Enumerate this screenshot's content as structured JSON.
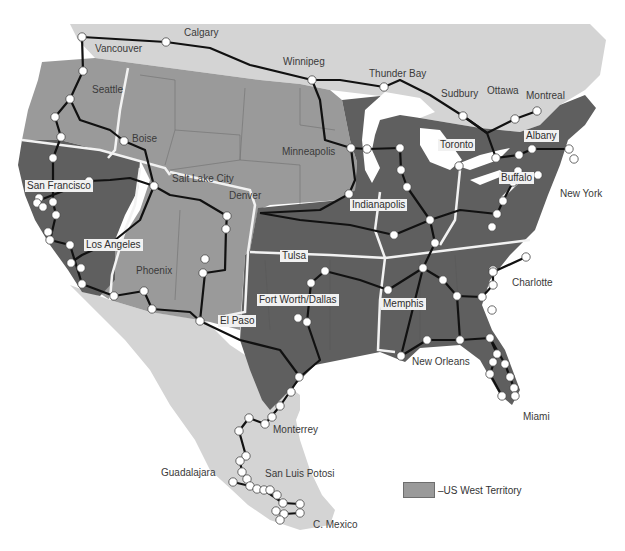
{
  "map": {
    "title": "Rail network territories",
    "colors": {
      "background": "#ffffff",
      "canada_mexico": "#d4d4d4",
      "us_west_territory": "#9a9a9a",
      "us_other": "#5f5f5f",
      "lakes": "#ffffff",
      "rail_line": "#111111",
      "territory_border": "#f2f2f2",
      "node_fill": "#ffffff"
    },
    "legend": {
      "swatch_color": "#9a9a9a",
      "label": "–US West Territory"
    },
    "cities": [
      {
        "name": "Vancouver",
        "boxed": false,
        "x": 95,
        "y": 43
      },
      {
        "name": "Calgary",
        "boxed": false,
        "x": 184,
        "y": 27
      },
      {
        "name": "Winnipeg",
        "boxed": false,
        "x": 283,
        "y": 56
      },
      {
        "name": "Thunder Bay",
        "boxed": false,
        "x": 369,
        "y": 68
      },
      {
        "name": "Sudbury",
        "boxed": false,
        "x": 441,
        "y": 88
      },
      {
        "name": "Ottawa",
        "boxed": false,
        "x": 487,
        "y": 85
      },
      {
        "name": "Montreal",
        "boxed": false,
        "x": 526,
        "y": 90
      },
      {
        "name": "Seattle",
        "boxed": false,
        "x": 92,
        "y": 84
      },
      {
        "name": "Boise",
        "boxed": false,
        "x": 132,
        "y": 133
      },
      {
        "name": "Minneapolis",
        "boxed": false,
        "x": 282,
        "y": 146
      },
      {
        "name": "Toronto",
        "boxed": true,
        "x": 438,
        "y": 139
      },
      {
        "name": "Albany",
        "boxed": true,
        "x": 524,
        "y": 130
      },
      {
        "name": "San Francisco",
        "boxed": true,
        "x": 25,
        "y": 180
      },
      {
        "name": "Salt Lake City",
        "boxed": false,
        "x": 172,
        "y": 173
      },
      {
        "name": "Denver",
        "boxed": false,
        "x": 229,
        "y": 190
      },
      {
        "name": "Indianapolis",
        "boxed": true,
        "x": 350,
        "y": 199
      },
      {
        "name": "Buffalo",
        "boxed": true,
        "x": 499,
        "y": 172
      },
      {
        "name": "New York",
        "boxed": false,
        "x": 560,
        "y": 188
      },
      {
        "name": "Los Angeles",
        "boxed": true,
        "x": 84,
        "y": 239
      },
      {
        "name": "Tulsa",
        "boxed": true,
        "x": 280,
        "y": 250
      },
      {
        "name": "Phoenix",
        "boxed": false,
        "x": 136,
        "y": 265
      },
      {
        "name": "Charlotte",
        "boxed": false,
        "x": 512,
        "y": 277
      },
      {
        "name": "Fort Worth/Dallas",
        "boxed": true,
        "x": 257,
        "y": 294
      },
      {
        "name": "Memphis",
        "boxed": true,
        "x": 381,
        "y": 298
      },
      {
        "name": "El Paso",
        "boxed": true,
        "x": 218,
        "y": 315
      },
      {
        "name": "New Orleans",
        "boxed": false,
        "x": 412,
        "y": 356
      },
      {
        "name": "Miami",
        "boxed": false,
        "x": 523,
        "y": 411
      },
      {
        "name": "Monterrey",
        "boxed": false,
        "x": 273,
        "y": 424
      },
      {
        "name": "San Luis Potosi",
        "boxed": false,
        "x": 265,
        "y": 468
      },
      {
        "name": "Guadalajara",
        "boxed": false,
        "x": 161,
        "y": 467
      },
      {
        "name": "C. Mexico",
        "boxed": false,
        "x": 313,
        "y": 519
      }
    ],
    "nodes": [
      [
        82,
        37
      ],
      [
        166,
        42
      ],
      [
        312,
        80
      ],
      [
        384,
        87
      ],
      [
        463,
        116
      ],
      [
        515,
        119
      ],
      [
        537,
        111
      ],
      [
        83,
        71
      ],
      [
        70,
        99
      ],
      [
        55,
        117
      ],
      [
        61,
        137
      ],
      [
        53,
        158
      ],
      [
        124,
        141
      ],
      [
        89,
        181
      ],
      [
        39,
        198
      ],
      [
        37,
        203
      ],
      [
        43,
        207
      ],
      [
        53,
        202
      ],
      [
        56,
        215
      ],
      [
        48,
        232
      ],
      [
        50,
        240
      ],
      [
        70,
        245
      ],
      [
        71,
        263
      ],
      [
        81,
        268
      ],
      [
        82,
        284
      ],
      [
        114,
        296
      ],
      [
        144,
        291
      ],
      [
        152,
        309
      ],
      [
        154,
        186
      ],
      [
        227,
        216
      ],
      [
        226,
        229
      ],
      [
        205,
        259
      ],
      [
        203,
        273
      ],
      [
        200,
        321
      ],
      [
        351,
        148
      ],
      [
        367,
        149
      ],
      [
        400,
        148
      ],
      [
        401,
        170
      ],
      [
        407,
        187
      ],
      [
        349,
        194
      ],
      [
        430,
        220
      ],
      [
        394,
        235
      ],
      [
        435,
        243
      ],
      [
        459,
        166
      ],
      [
        496,
        158
      ],
      [
        519,
        155
      ],
      [
        518,
        171
      ],
      [
        532,
        149
      ],
      [
        569,
        149
      ],
      [
        574,
        159
      ],
      [
        538,
        175
      ],
      [
        513,
        182
      ],
      [
        503,
        201
      ],
      [
        497,
        214
      ],
      [
        492,
        227
      ],
      [
        325,
        271
      ],
      [
        311,
        283
      ],
      [
        298,
        318
      ],
      [
        307,
        322
      ],
      [
        388,
        290
      ],
      [
        423,
        268
      ],
      [
        443,
        280
      ],
      [
        457,
        296
      ],
      [
        493,
        270
      ],
      [
        526,
        257
      ],
      [
        493,
        272
      ],
      [
        493,
        285
      ],
      [
        482,
        297
      ],
      [
        492,
        310
      ],
      [
        401,
        356
      ],
      [
        427,
        340
      ],
      [
        460,
        340
      ],
      [
        490,
        338
      ],
      [
        497,
        354
      ],
      [
        493,
        362
      ],
      [
        505,
        364
      ],
      [
        490,
        374
      ],
      [
        510,
        377
      ],
      [
        514,
        388
      ],
      [
        502,
        396
      ],
      [
        515,
        396
      ],
      [
        299,
        377
      ],
      [
        291,
        392
      ],
      [
        280,
        406
      ],
      [
        272,
        417
      ],
      [
        265,
        424
      ],
      [
        249,
        418
      ],
      [
        239,
        431
      ],
      [
        246,
        456
      ],
      [
        240,
        461
      ],
      [
        242,
        472
      ],
      [
        247,
        479
      ],
      [
        233,
        482
      ],
      [
        250,
        486
      ],
      [
        257,
        489
      ],
      [
        264,
        490
      ],
      [
        270,
        490
      ],
      [
        277,
        495
      ],
      [
        283,
        503
      ],
      [
        276,
        511
      ],
      [
        284,
        514
      ],
      [
        300,
        504
      ],
      [
        300,
        513
      ],
      [
        280,
        520
      ]
    ]
  }
}
